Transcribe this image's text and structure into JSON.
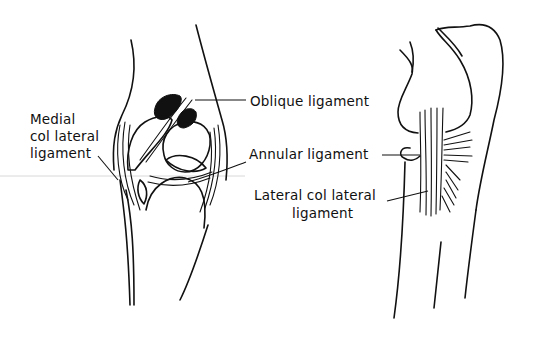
{
  "figure": {
    "left_view": {
      "description": "Anterior view of elbow joint ligaments",
      "labels": {
        "medial_line1": "Medial",
        "medial_line2": "col lateral",
        "medial_line3": "ligament",
        "oblique": "Oblique ligament",
        "annular": "Annular ligament"
      }
    },
    "right_view": {
      "description": "Lateral view of elbow joint ligaments",
      "labels": {
        "lateral_line1": "Lateral  col lateral",
        "lateral_line2": "ligament"
      }
    },
    "colors": {
      "ink": "#111111",
      "background": "#ffffff",
      "scan_artifact_line": "#d8d8d8"
    }
  }
}
